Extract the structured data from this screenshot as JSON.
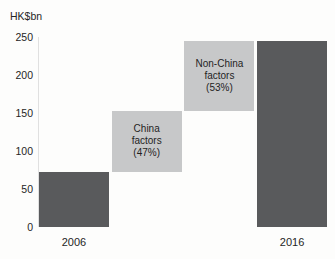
{
  "colors": {
    "total_bar": "#595a5c",
    "delta_bar": "#c7c8c9",
    "axis_line": "#e0e0e0",
    "text": "#252525",
    "bar_text": "#1f1f1f",
    "background": "#fdfdfc"
  },
  "chart_data": {
    "type": "bar",
    "subtype": "waterfall",
    "title": "",
    "ylabel": "HK$bn",
    "xlabel": "",
    "ylim": [
      0,
      250
    ],
    "yticks": [
      0,
      50,
      100,
      150,
      200,
      250
    ],
    "grid": false,
    "legend": "none",
    "categories": [
      "2006",
      "China factors (47%)",
      "Non-China factors (53%)",
      "2016"
    ],
    "bars": [
      {
        "label": "2006",
        "role": "total",
        "start": 0,
        "end": 72,
        "value": 72,
        "axis_label": "2006",
        "text_lines": []
      },
      {
        "label": "China factors (47%)",
        "role": "delta",
        "start": 72,
        "end": 153,
        "value": 81,
        "percent_of_increase": "47%",
        "axis_label": "",
        "text_lines": [
          "China",
          "factors",
          "(47%)"
        ]
      },
      {
        "label": "Non-China factors (53%)",
        "role": "delta",
        "start": 153,
        "end": 245,
        "value": 92,
        "percent_of_increase": "53%",
        "axis_label": "",
        "text_lines": [
          "Non-China",
          "factors",
          "(53%)"
        ]
      },
      {
        "label": "2016",
        "role": "total",
        "start": 0,
        "end": 245,
        "value": 245,
        "axis_label": "2016",
        "text_lines": []
      }
    ]
  }
}
